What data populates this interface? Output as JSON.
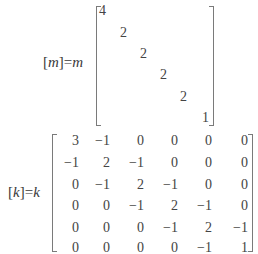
{
  "mass_matrix": {
    "lhs": {
      "open": "[",
      "symbol": "m",
      "close": "]",
      "equals": "=",
      "scalar": "m"
    },
    "diagonal": [
      "4",
      "2",
      "2",
      "2",
      "2",
      "1"
    ]
  },
  "stiffness_matrix": {
    "lhs": {
      "open": "[",
      "symbol": "k",
      "close": "]",
      "equals": "=",
      "scalar": "k"
    },
    "rows": [
      [
        "3",
        "−1",
        "0",
        "0",
        "0",
        "0"
      ],
      [
        "−1",
        "2",
        "−1",
        "0",
        "0",
        "0"
      ],
      [
        "0",
        "−1",
        "2",
        "−1",
        "0",
        "0"
      ],
      [
        "0",
        "0",
        "−1",
        "2",
        "−1",
        "0"
      ],
      [
        "0",
        "0",
        "0",
        "−1",
        "2",
        "−1"
      ],
      [
        "0",
        "0",
        "0",
        "0",
        "−1",
        "1"
      ]
    ]
  }
}
